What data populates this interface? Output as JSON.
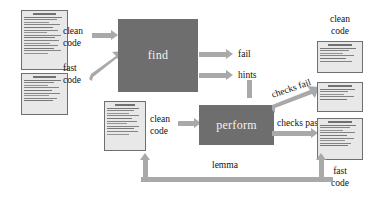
{
  "diagram": {
    "background_color": "#ffffff",
    "box_color": "#6e6e6e",
    "arrow_color": "#a9a9a9",
    "code_block_color": "#e8e8e8",
    "text_color": "#111111"
  },
  "boxes": [
    {
      "id": "find",
      "label": "find"
    },
    {
      "id": "perform",
      "label": "perform"
    }
  ],
  "edge_labels": {
    "clean_code_in": "clean\ncode",
    "fast_code_in": "fast\ncode",
    "fail": "fail",
    "hints": "hints",
    "clean_code_mid": "clean\ncode",
    "checks_fail": "checks fail",
    "checks_pass": "checks pass",
    "lemma": "lemma"
  },
  "output_labels": {
    "clean_code_out": "clean\ncode",
    "fast_code_out": "fast\ncode"
  },
  "code_blocks": [
    {
      "id": "input-clean-code",
      "caption": ""
    },
    {
      "id": "input-fast-code",
      "caption": ""
    },
    {
      "id": "middle-clean-code",
      "caption": ""
    },
    {
      "id": "output-clean-code",
      "caption": ""
    },
    {
      "id": "output-checks-fail",
      "caption": ""
    },
    {
      "id": "output-fast-code",
      "caption": ""
    }
  ]
}
